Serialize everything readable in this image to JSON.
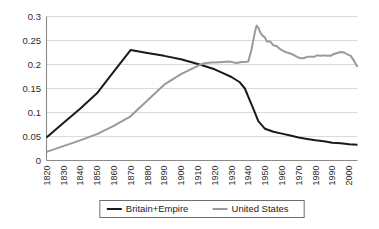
{
  "chart_data": {
    "type": "line",
    "title": "",
    "subtitle": "",
    "xlabel": "",
    "ylabel": "",
    "xlim": [
      1820,
      2005
    ],
    "ylim": [
      0,
      0.3
    ],
    "grid": "horizontal",
    "legend_position": "bottom-center",
    "ytick_labels": [
      "0",
      "0.05",
      "0.1",
      "0.15",
      "0.2",
      "0.25",
      "0.3"
    ],
    "ytick_values": [
      0,
      0.05,
      0.1,
      0.15,
      0.2,
      0.25,
      0.3
    ],
    "xtick_labels": [
      "1820",
      "1830",
      "1840",
      "1850",
      "1860",
      "1870",
      "1880",
      "1890",
      "1900",
      "1910",
      "1920",
      "1930",
      "1940",
      "1950",
      "1960",
      "1970",
      "1980",
      "1990",
      "2000"
    ],
    "xtick_values": [
      1820,
      1830,
      1840,
      1850,
      1860,
      1870,
      1880,
      1890,
      1900,
      1910,
      1920,
      1930,
      1940,
      1950,
      1960,
      1970,
      1980,
      1990,
      2000
    ],
    "series": [
      {
        "name": "Britain+Empire",
        "color": "#1a1a1a",
        "width": 2.0,
        "x": [
          1820,
          1830,
          1840,
          1850,
          1860,
          1870,
          1880,
          1890,
          1900,
          1910,
          1913,
          1920,
          1925,
          1930,
          1935,
          1938,
          1940,
          1943,
          1946,
          1950,
          1955,
          1960,
          1965,
          1970,
          1975,
          1980,
          1985,
          1990,
          1995,
          2000,
          2005
        ],
        "y": [
          0.048,
          0.078,
          0.108,
          0.14,
          0.185,
          0.23,
          0.224,
          0.218,
          0.211,
          0.201,
          0.198,
          0.19,
          0.182,
          0.174,
          0.163,
          0.15,
          0.133,
          0.108,
          0.082,
          0.066,
          0.06,
          0.056,
          0.052,
          0.048,
          0.045,
          0.042,
          0.04,
          0.037,
          0.036,
          0.034,
          0.033
        ]
      },
      {
        "name": "United States",
        "color": "#9a9a9a",
        "width": 2.0,
        "x": [
          1820,
          1830,
          1840,
          1850,
          1860,
          1870,
          1880,
          1890,
          1900,
          1910,
          1913,
          1918,
          1920,
          1925,
          1929,
          1933,
          1936,
          1938,
          1940,
          1942,
          1944,
          1945,
          1946,
          1947,
          1948,
          1950,
          1951,
          1953,
          1955,
          1957,
          1959,
          1961,
          1963,
          1965,
          1967,
          1969,
          1971,
          1973,
          1975,
          1977,
          1979,
          1981,
          1983,
          1985,
          1987,
          1989,
          1991,
          1993,
          1995,
          1997,
          1999,
          2001,
          2003,
          2005
        ],
        "y": [
          0.018,
          0.03,
          0.042,
          0.055,
          0.072,
          0.092,
          0.125,
          0.158,
          0.18,
          0.197,
          0.202,
          0.204,
          0.204,
          0.205,
          0.206,
          0.203,
          0.205,
          0.205,
          0.206,
          0.232,
          0.268,
          0.281,
          0.277,
          0.268,
          0.262,
          0.256,
          0.248,
          0.248,
          0.24,
          0.238,
          0.232,
          0.228,
          0.225,
          0.223,
          0.22,
          0.216,
          0.213,
          0.213,
          0.216,
          0.216,
          0.216,
          0.219,
          0.218,
          0.219,
          0.218,
          0.218,
          0.222,
          0.224,
          0.226,
          0.225,
          0.221,
          0.218,
          0.207,
          0.195
        ]
      }
    ],
    "legend": [
      {
        "label": "Britain+Empire",
        "color": "#1a1a1a"
      },
      {
        "label": "United States",
        "color": "#9a9a9a"
      }
    ]
  }
}
